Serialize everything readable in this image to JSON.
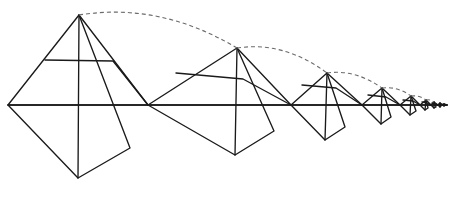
{
  "figure": {
    "type": "geometric-diagram",
    "canvas": {
      "width": 453,
      "height": 204,
      "background": "#ffffff"
    },
    "colors": {
      "solid_line": "#1a1a1a",
      "dashed_arc": "#6b6b6b",
      "background": "#ffffff"
    },
    "baseline": {
      "label": "horizontal axis",
      "y": 105,
      "x_start": 8,
      "x_end": 447
    },
    "scale_ratio": 0.495,
    "node_x_positions": [
      8,
      148,
      291,
      362,
      400,
      420,
      431,
      438,
      443,
      447
    ],
    "squares": [
      {
        "index": 1,
        "left": [
          8,
          105
        ],
        "apex": [
          79,
          15
        ],
        "right": [
          148,
          105
        ],
        "bottom": [
          78,
          178
        ],
        "inner_point": [
          130,
          148
        ],
        "mid_left": [
          45,
          60
        ],
        "mid_edge": [
          113,
          61
        ]
      },
      {
        "index": 2,
        "left": [
          148,
          105
        ],
        "apex": [
          237,
          48
        ],
        "right": [
          291,
          105
        ],
        "bottom": [
          235,
          155
        ],
        "inner_point": [
          274,
          131
        ],
        "mid_left": [
          176,
          73
        ],
        "mid_edge": [
          243,
          79
        ]
      },
      {
        "index": 3,
        "left": [
          291,
          105
        ],
        "apex": [
          327,
          73
        ],
        "right": [
          362,
          105
        ],
        "bottom": [
          325,
          140
        ],
        "inner_point": [
          345,
          127
        ],
        "mid_left": [
          302,
          85
        ],
        "mid_edge": [
          336,
          88
        ]
      },
      {
        "index": 4,
        "left": [
          362,
          105
        ],
        "apex": [
          382,
          88
        ],
        "right": [
          400,
          105
        ],
        "bottom": [
          381,
          124
        ],
        "inner_point": [
          391,
          117
        ],
        "mid_left": [
          368,
          95
        ],
        "mid_edge": [
          386,
          97
        ]
      },
      {
        "index": 5,
        "left": [
          400,
          105
        ],
        "apex": [
          411,
          96
        ],
        "right": [
          420,
          105
        ],
        "bottom": [
          410,
          115
        ],
        "inner_point": [
          416,
          111
        ],
        "mid_left": [
          403,
          100
        ],
        "mid_edge": [
          413,
          101
        ]
      },
      {
        "index": 6,
        "left": [
          420,
          105
        ],
        "apex": [
          426,
          100
        ],
        "right": [
          431,
          105
        ],
        "bottom": [
          425,
          110
        ],
        "inner_point": [
          428,
          108
        ],
        "mid_left": [
          422,
          102
        ],
        "mid_edge": [
          427,
          103
        ]
      },
      {
        "index": 7,
        "left": [
          431,
          105
        ],
        "apex": [
          434,
          102
        ],
        "right": [
          438,
          105
        ],
        "bottom": [
          434,
          108
        ],
        "inner_point": [
          436,
          107
        ],
        "mid_left": [
          432,
          103
        ],
        "mid_edge": [
          435,
          104
        ]
      },
      {
        "index": 8,
        "left": [
          438,
          105
        ],
        "apex": [
          440,
          103
        ],
        "right": [
          443,
          105
        ],
        "bottom": [
          440,
          107
        ],
        "inner_point": [
          441,
          106
        ],
        "mid_left": [
          439,
          104
        ],
        "mid_edge": [
          441,
          104
        ]
      },
      {
        "index": 9,
        "left": [
          443,
          105
        ],
        "apex": [
          444,
          104
        ],
        "right": [
          447,
          105
        ],
        "bottom": [
          444,
          106
        ],
        "inner_point": [
          446,
          105
        ],
        "mid_left": [
          443,
          104
        ],
        "mid_edge": [
          445,
          105
        ]
      }
    ],
    "dashed_arcs": [
      {
        "index": 1,
        "from": [
          79,
          15
        ],
        "to": [
          237,
          48
        ],
        "control": [
          160,
          2
        ]
      },
      {
        "index": 2,
        "from": [
          237,
          48
        ],
        "to": [
          327,
          73
        ],
        "control": [
          284,
          41
        ]
      },
      {
        "index": 3,
        "from": [
          327,
          73
        ],
        "to": [
          382,
          88
        ],
        "control": [
          355,
          69
        ]
      },
      {
        "index": 4,
        "from": [
          382,
          88
        ],
        "to": [
          411,
          96
        ],
        "control": [
          397,
          86
        ]
      },
      {
        "index": 5,
        "from": [
          411,
          96
        ],
        "to": [
          426,
          100
        ],
        "control": [
          419,
          95
        ]
      },
      {
        "index": 6,
        "from": [
          426,
          100
        ],
        "to": [
          434,
          102
        ],
        "control": [
          430,
          99
        ]
      }
    ]
  }
}
